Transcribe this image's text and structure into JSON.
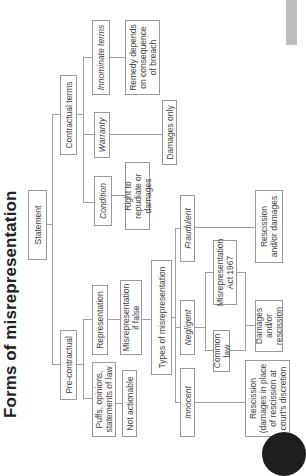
{
  "title": "Forms of misrepresentation",
  "nodes": {
    "statement": "Statement",
    "pre_contractual": "Pre-contractual",
    "contractual_terms": "Contractual terms",
    "condition": "Condition",
    "warranty": "Warranty",
    "innominate_terms": "Innominate terms",
    "right_to_repudiate": "Right to repudiate or damages",
    "damages_only": "Damages only",
    "remedy_depends": "Remedy depends on consequence of breach",
    "representation": "Representation",
    "puffs": "Puffs, opinions, statements of law",
    "misrep_if_false": "Misrepresentation if false",
    "not_actionable": "Not actionable",
    "types_of_misrep": "Types of misrepresentation",
    "fraudulent": "Fraudulent",
    "negligent": "Negligent",
    "innocent": "Innocent",
    "misrep_act": "Misrepresentation Act 1967",
    "common_law": "Common law",
    "rescission_and_or_damages": "Rescission and/or damages",
    "damages_and_or_rescission": "Damages and/or rescission",
    "rescission_discretion": "Rescission (damages in place of rescission at court's discretion"
  },
  "colors": {
    "line": "#a0a0a0",
    "box_border": "#9a9a9a",
    "text": "#444444",
    "title": "#222222",
    "side_tab": "#bdbdbd",
    "page_dot": "#1e1e1e"
  },
  "orientation": "rotated-90-ccw"
}
